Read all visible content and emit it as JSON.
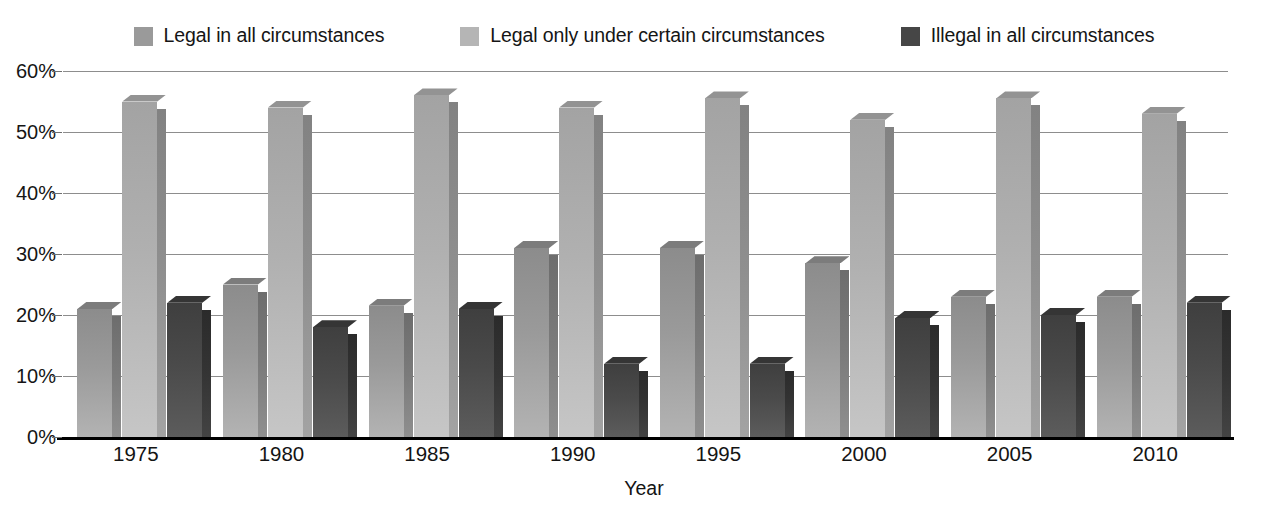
{
  "chart_data": {
    "type": "bar",
    "title": "",
    "subtitle": "",
    "xlabel": "Year",
    "ylabel": "",
    "categories": [
      "1975",
      "1980",
      "1985",
      "1990",
      "1995",
      "2000",
      "2005",
      "2010"
    ],
    "series": [
      {
        "name": "Legal in all circumstances",
        "color": "#9a9a9a",
        "values": [
          21,
          25,
          21.5,
          31,
          31,
          28.5,
          23,
          23
        ]
      },
      {
        "name": "Legal only under certain circumstances",
        "color": "#b5b5b5",
        "values": [
          55,
          54,
          56,
          54,
          55.5,
          52,
          55.5,
          53
        ]
      },
      {
        "name": "Illegal in all circumstances",
        "color": "#464646",
        "values": [
          22,
          18,
          21,
          12,
          12,
          19.5,
          20,
          22
        ]
      }
    ],
    "ylim": [
      0,
      60
    ],
    "ytick_step": 10,
    "ytick_labels": [
      "60%",
      "50%",
      "40%",
      "30%",
      "20%",
      "10%",
      "0%"
    ],
    "ytick_values": [
      60,
      50,
      40,
      30,
      20,
      10,
      0
    ],
    "grid": true,
    "legend_position": "top",
    "value_suffix": "%"
  },
  "legend": {
    "items": [
      {
        "label": "Legal in all circumstances",
        "color": "#9a9a9a"
      },
      {
        "label": "Legal only under certain circumstances",
        "color": "#b5b5b5"
      },
      {
        "label": "Illegal in all circumstances",
        "color": "#464646"
      }
    ]
  },
  "axes": {
    "x_title": "Year",
    "y_ticks": [
      "60%",
      "50%",
      "40%",
      "30%",
      "20%",
      "10%",
      "0%"
    ],
    "x_ticks": [
      "1975",
      "1980",
      "1985",
      "1990",
      "1995",
      "2000",
      "2005",
      "2010"
    ]
  }
}
